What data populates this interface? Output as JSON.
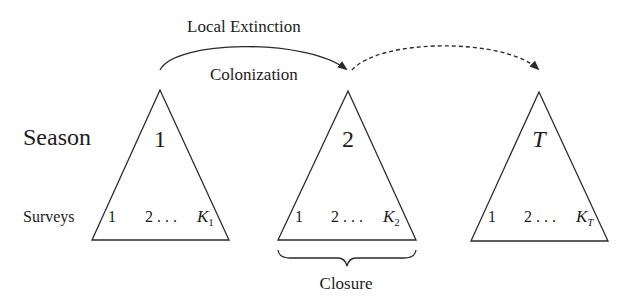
{
  "diagram": {
    "arrows": {
      "local_extinction_label": "Local Extinction",
      "colonization_label": "Colonization"
    },
    "row_labels": {
      "season": "Season",
      "surveys": "Surveys"
    },
    "seasons": [
      {
        "label": "1",
        "italic": false,
        "surveys": {
          "first": "1",
          "middle": "2 . . .",
          "last_base": "K",
          "last_sub": "1"
        }
      },
      {
        "label": "2",
        "italic": false,
        "surveys": {
          "first": "1",
          "middle": "2 . . .",
          "last_base": "K",
          "last_sub": "2"
        }
      },
      {
        "label": "T",
        "italic": true,
        "surveys": {
          "first": "1",
          "middle": "2 . . .",
          "last_base": "K",
          "last_sub": "T"
        }
      }
    ],
    "brace_label": "Closure",
    "colors": {
      "stroke": "#2a2a2a",
      "text": "#1c1c1c",
      "background": "#ffffff"
    }
  }
}
